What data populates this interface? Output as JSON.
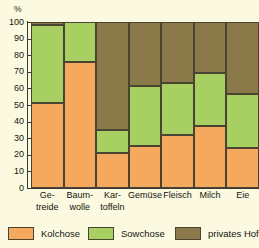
{
  "chart_data": {
    "type": "bar",
    "subtype": "stacked-percentage-column",
    "title": "",
    "xlabel": "",
    "ylabel": "%",
    "ylim": [
      0,
      100
    ],
    "yticks": [
      0,
      10,
      20,
      30,
      40,
      50,
      60,
      70,
      80,
      90,
      100
    ],
    "ytick_labels": [
      "0",
      "10",
      "20",
      "30",
      "40",
      "50",
      "60",
      "70",
      "80",
      "90",
      "100"
    ],
    "grid": false,
    "legend_position": "bottom",
    "categories": [
      "Ge-\ntreide",
      "Baum-\nwolle",
      "Kar-\ntoffeln",
      "Gemüse",
      "Fleisch",
      "Milch",
      "Eie"
    ],
    "category_labels_flat": [
      "Getreide",
      "Baumwolle",
      "Kartoffeln",
      "Gemüse",
      "Fleisch",
      "Milch",
      "Eier"
    ],
    "series": [
      {
        "name": "Kolchose",
        "color": "#f5a95e",
        "values": [
          51,
          76,
          21,
          25.5,
          32,
          37.5,
          24
        ]
      },
      {
        "name": "Sowchose",
        "color": "#a8cf62",
        "values": [
          47,
          24,
          14,
          36,
          31,
          31.5,
          32.5
        ]
      },
      {
        "name": "privates Hofland",
        "color": "#8a7a4a",
        "values": [
          2,
          0,
          65,
          38.5,
          37,
          31,
          43.5
        ]
      }
    ]
  },
  "axis": {
    "unit_label": "%"
  },
  "legend": {
    "items": [
      {
        "label": "Kolchose",
        "swatch": "kolchose"
      },
      {
        "label": "Sowchose",
        "swatch": "sowchose"
      },
      {
        "label": "privates Hofl",
        "swatch": "privat"
      }
    ]
  },
  "colors": {
    "kolchose": "#f5a95e",
    "sowchose": "#a8cf62",
    "privat": "#8a7a4a",
    "background": "#fbfae0",
    "outline": "#4a4432",
    "axis": "#3a3a30"
  }
}
